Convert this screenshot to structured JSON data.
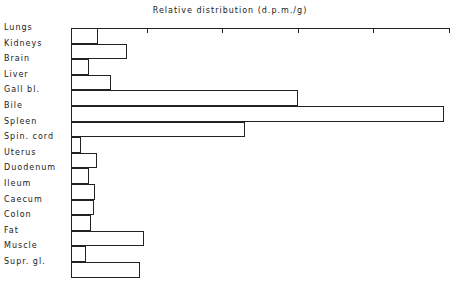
{
  "chart_data": {
    "type": "bar",
    "orientation": "horizontal",
    "title": "Relative distribution (d.p.m./g)",
    "xlabel": "",
    "ylabel": "",
    "axis_position": "top",
    "tick_count": 5,
    "tick_labels_visible": false,
    "grid": false,
    "units_note": "values expressed relative to Bile = 100 (no numeric tick labels shown)",
    "categories": [
      "Lungs",
      "Kidneys",
      "Brain",
      "Liver",
      "Gall bl.",
      "Bile",
      "Spleen",
      "Spin. cord",
      "Uterus",
      "Duodenum",
      "Ileum",
      "Caecum",
      "Colon",
      "Fat",
      "Muscle",
      "Supr. gl."
    ],
    "values": [
      7.2,
      15.0,
      4.8,
      10.7,
      60.9,
      100,
      46.6,
      2.7,
      7.0,
      4.8,
      6.4,
      6.2,
      5.4,
      19.6,
      4.0,
      18.5
    ],
    "xlim": [
      0,
      101.3
    ]
  }
}
